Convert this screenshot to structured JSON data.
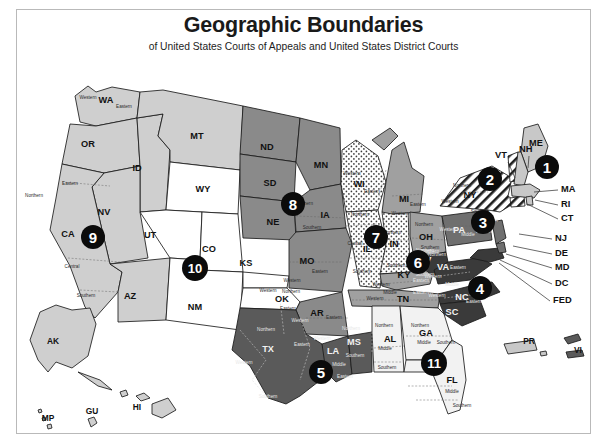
{
  "header": {
    "title": "Geographic Boundaries",
    "subtitle": "of United States Courts of Appeals and United States District Courts"
  },
  "colors": {
    "c1": "#c8c8c8",
    "c2": "#ffffff",
    "c3": "#6f6f6f",
    "c4": "#3a3a3a",
    "c5": "#5a5a5a",
    "c6": "#a0a0a0",
    "c7": "#ffffff",
    "c8": "#8a8a8a",
    "c9": "#cfcfcf",
    "c10": "#ffffff",
    "c11": "#f2f2f2",
    "border": "#1b1b1b",
    "badge_fill": "#0b0b0b",
    "badge_text": "#ffffff",
    "frame": "#b9b9b9"
  },
  "circuits": [
    {
      "number": "1",
      "badge_x": 547,
      "badge_y": 167,
      "shade": "c1",
      "states": [
        "ME",
        "NH",
        "MA",
        "RI",
        "PR"
      ]
    },
    {
      "number": "2",
      "badge_x": 490,
      "badge_y": 179,
      "shade": "c2",
      "states": [
        "VT",
        "NY",
        "CT"
      ],
      "pattern": "hatch"
    },
    {
      "number": "3",
      "badge_x": 483,
      "badge_y": 222,
      "shade": "c3",
      "states": [
        "PA",
        "NJ",
        "DE",
        "VI"
      ]
    },
    {
      "number": "4",
      "badge_x": 480,
      "badge_y": 288,
      "shade": "c4",
      "states": [
        "MD",
        "WV",
        "VA",
        "NC",
        "SC"
      ]
    },
    {
      "number": "5",
      "badge_x": 321,
      "badge_y": 372,
      "shade": "c5",
      "states": [
        "TX",
        "LA",
        "MS"
      ]
    },
    {
      "number": "6",
      "badge_x": 418,
      "badge_y": 262,
      "shade": "c6",
      "states": [
        "MI",
        "OH",
        "KY",
        "TN"
      ]
    },
    {
      "number": "7",
      "badge_x": 376,
      "badge_y": 237,
      "shade": "c7",
      "states": [
        "WI",
        "IL",
        "IN"
      ],
      "pattern": "dots"
    },
    {
      "number": "8",
      "badge_x": 293,
      "badge_y": 204,
      "shade": "c8",
      "states": [
        "ND",
        "SD",
        "MN",
        "IA",
        "NE",
        "MO",
        "AR"
      ]
    },
    {
      "number": "9",
      "badge_x": 93,
      "badge_y": 237,
      "shade": "c9",
      "states": [
        "WA",
        "OR",
        "ID",
        "MT",
        "NV",
        "CA",
        "AZ",
        "AK",
        "HI",
        "GU",
        "MP"
      ]
    },
    {
      "number": "10",
      "badge_x": 195,
      "badge_y": 268,
      "shade": "c10",
      "states": [
        "WY",
        "UT",
        "CO",
        "KS",
        "NM",
        "OK"
      ]
    },
    {
      "number": "11",
      "badge_x": 434,
      "badge_y": 363,
      "shade": "c11",
      "states": [
        "AL",
        "GA",
        "FL"
      ]
    }
  ],
  "state_labels": [
    {
      "abbr": "WA",
      "x": 106,
      "y": 101
    },
    {
      "abbr": "OR",
      "x": 88,
      "y": 145
    },
    {
      "abbr": "ID",
      "x": 137,
      "y": 169
    },
    {
      "abbr": "MT",
      "x": 197,
      "y": 137
    },
    {
      "abbr": "ND",
      "x": 267,
      "y": 148
    },
    {
      "abbr": "SD",
      "x": 270,
      "y": 184
    },
    {
      "abbr": "MN",
      "x": 321,
      "y": 166
    },
    {
      "abbr": "WY",
      "x": 203,
      "y": 190
    },
    {
      "abbr": "NV",
      "x": 104,
      "y": 213
    },
    {
      "abbr": "CA",
      "x": 68,
      "y": 235
    },
    {
      "abbr": "UT",
      "x": 150,
      "y": 236
    },
    {
      "abbr": "CO",
      "x": 209,
      "y": 250
    },
    {
      "abbr": "NE",
      "x": 273,
      "y": 223
    },
    {
      "abbr": "IA",
      "x": 325,
      "y": 216
    },
    {
      "abbr": "KS",
      "x": 246,
      "y": 264
    },
    {
      "abbr": "MO",
      "x": 307,
      "y": 262
    },
    {
      "abbr": "AZ",
      "x": 130,
      "y": 297
    },
    {
      "abbr": "NM",
      "x": 195,
      "y": 308
    },
    {
      "abbr": "OK",
      "x": 282,
      "y": 300
    },
    {
      "abbr": "AR",
      "x": 317,
      "y": 314
    },
    {
      "abbr": "WI",
      "x": 359,
      "y": 185
    },
    {
      "abbr": "MI",
      "x": 404,
      "y": 200
    },
    {
      "abbr": "IL",
      "x": 367,
      "y": 250
    },
    {
      "abbr": "IN",
      "x": 394,
      "y": 245
    },
    {
      "abbr": "OH",
      "x": 426,
      "y": 238
    },
    {
      "abbr": "KY",
      "x": 404,
      "y": 276
    },
    {
      "abbr": "TN",
      "x": 403,
      "y": 300
    },
    {
      "abbr": "MS",
      "x": 354,
      "y": 343
    },
    {
      "abbr": "AL",
      "x": 390,
      "y": 340
    },
    {
      "abbr": "GA",
      "x": 426,
      "y": 334
    },
    {
      "abbr": "LA",
      "x": 333,
      "y": 352
    },
    {
      "abbr": "TX",
      "x": 268,
      "y": 350
    },
    {
      "abbr": "FL",
      "x": 452,
      "y": 381
    },
    {
      "abbr": "SC",
      "x": 452,
      "y": 313
    },
    {
      "abbr": "NC",
      "x": 462,
      "y": 298
    },
    {
      "abbr": "VA",
      "x": 443,
      "y": 268
    },
    {
      "abbr": "WV",
      "x": 424,
      "y": 261
    },
    {
      "abbr": "PA",
      "x": 459,
      "y": 231
    },
    {
      "abbr": "NY",
      "x": 470,
      "y": 196
    },
    {
      "abbr": "ME",
      "x": 536,
      "y": 144
    }
  ],
  "territory_labels": [
    {
      "abbr": "AK",
      "x": 53,
      "y": 342
    },
    {
      "abbr": "HI",
      "x": 137,
      "y": 408
    },
    {
      "abbr": "GU",
      "x": 92,
      "y": 412
    },
    {
      "abbr": "MP",
      "x": 48,
      "y": 419
    },
    {
      "abbr": "PR",
      "x": 529,
      "y": 342
    },
    {
      "abbr": "VI",
      "x": 578,
      "y": 351
    }
  ],
  "district_labels": [
    {
      "text": "Western",
      "x": 88,
      "y": 98
    },
    {
      "text": "Eastern",
      "x": 124,
      "y": 107
    },
    {
      "text": "Northern",
      "x": 34,
      "y": 196
    },
    {
      "text": "Eastern",
      "x": 70,
      "y": 184
    },
    {
      "text": "Central",
      "x": 72,
      "y": 267
    },
    {
      "text": "Southern",
      "x": 86,
      "y": 296
    },
    {
      "text": "Northern",
      "x": 304,
      "y": 204
    },
    {
      "text": "Southern",
      "x": 312,
      "y": 228
    },
    {
      "text": "Eastern",
      "x": 320,
      "y": 272
    },
    {
      "text": "Western",
      "x": 292,
      "y": 281
    },
    {
      "text": "Western",
      "x": 268,
      "y": 291
    },
    {
      "text": "Northern",
      "x": 291,
      "y": 292
    },
    {
      "text": "Eastern",
      "x": 288,
      "y": 309
    },
    {
      "text": "Western",
      "x": 300,
      "y": 321
    },
    {
      "text": "Eastern",
      "x": 334,
      "y": 318
    },
    {
      "text": "Northern",
      "x": 266,
      "y": 330
    },
    {
      "text": "Western",
      "x": 244,
      "y": 363
    },
    {
      "text": "Eastern",
      "x": 302,
      "y": 345
    },
    {
      "text": "Southern",
      "x": 268,
      "y": 397
    },
    {
      "text": "Western",
      "x": 322,
      "y": 339
    },
    {
      "text": "Middle",
      "x": 339,
      "y": 365
    },
    {
      "text": "Eastern",
      "x": 345,
      "y": 377
    },
    {
      "text": "Northern",
      "x": 351,
      "y": 329
    },
    {
      "text": "Southern",
      "x": 355,
      "y": 356
    },
    {
      "text": "Northern",
      "x": 384,
      "y": 326
    },
    {
      "text": "Middle",
      "x": 385,
      "y": 349
    },
    {
      "text": "Southern",
      "x": 387,
      "y": 368
    },
    {
      "text": "Northern",
      "x": 420,
      "y": 326
    },
    {
      "text": "Middle",
      "x": 424,
      "y": 343
    },
    {
      "text": "Southern",
      "x": 446,
      "y": 343
    },
    {
      "text": "Middle",
      "x": 452,
      "y": 392
    },
    {
      "text": "Southern",
      "x": 462,
      "y": 406
    },
    {
      "text": "Western",
      "x": 352,
      "y": 174
    },
    {
      "text": "Eastern",
      "x": 372,
      "y": 192
    },
    {
      "text": "Northern",
      "x": 360,
      "y": 215
    },
    {
      "text": "Central",
      "x": 355,
      "y": 244
    },
    {
      "text": "Southern",
      "x": 362,
      "y": 272
    },
    {
      "text": "Northern",
      "x": 392,
      "y": 233
    },
    {
      "text": "Southern",
      "x": 396,
      "y": 266
    },
    {
      "text": "Eastern",
      "x": 418,
      "y": 205
    },
    {
      "text": "Western",
      "x": 400,
      "y": 214
    },
    {
      "text": "Northern",
      "x": 424,
      "y": 225
    },
    {
      "text": "Southern",
      "x": 430,
      "y": 248
    },
    {
      "text": "Western",
      "x": 381,
      "y": 285
    },
    {
      "text": "Eastern",
      "x": 421,
      "y": 281
    },
    {
      "text": "Middle",
      "x": 390,
      "y": 293
    },
    {
      "text": "Eastern",
      "x": 421,
      "y": 293
    },
    {
      "text": "Western",
      "x": 375,
      "y": 299
    },
    {
      "text": "Northern",
      "x": 430,
      "y": 252
    },
    {
      "text": "Northern",
      "x": 425,
      "y": 251
    },
    {
      "text": "Northern",
      "x": 437,
      "y": 255
    },
    {
      "text": "Southern",
      "x": 425,
      "y": 275
    },
    {
      "text": "Western",
      "x": 433,
      "y": 277
    },
    {
      "text": "Eastern",
      "x": 458,
      "y": 268
    },
    {
      "text": "Middle",
      "x": 452,
      "y": 285
    },
    {
      "text": "Western",
      "x": 437,
      "y": 296
    },
    {
      "text": "Eastern",
      "x": 474,
      "y": 302
    },
    {
      "text": "Western",
      "x": 448,
      "y": 230
    },
    {
      "text": "Middle",
      "x": 468,
      "y": 235
    },
    {
      "text": "Eastern",
      "x": 484,
      "y": 232
    },
    {
      "text": "Northern",
      "x": 462,
      "y": 186
    },
    {
      "text": "Western",
      "x": 450,
      "y": 202
    },
    {
      "text": "Southern",
      "x": 480,
      "y": 212
    },
    {
      "text": "Eastern",
      "x": 490,
      "y": 221
    }
  ],
  "callouts": [
    {
      "label": "VT",
      "text_x": 495,
      "text_y": 156,
      "ax": 508,
      "ay": 162,
      "bx": 515,
      "by": 178
    },
    {
      "label": "NH",
      "text_x": 519,
      "text_y": 150,
      "ax": 529,
      "ay": 156,
      "bx": 528,
      "by": 168
    },
    {
      "label": "MA",
      "text_x": 561,
      "text_y": 190,
      "ax": 558,
      "ay": 190,
      "bx": 534,
      "by": 192
    },
    {
      "label": "RI",
      "text_x": 561,
      "text_y": 205,
      "ax": 558,
      "ay": 205,
      "bx": 535,
      "by": 200
    },
    {
      "label": "CT",
      "text_x": 561,
      "text_y": 219,
      "ax": 558,
      "ay": 219,
      "bx": 527,
      "by": 204
    },
    {
      "label": "NJ",
      "text_x": 555,
      "text_y": 239,
      "ax": 552,
      "ay": 239,
      "bx": 519,
      "by": 234
    },
    {
      "label": "DE",
      "text_x": 555,
      "text_y": 254,
      "ax": 552,
      "ay": 254,
      "bx": 513,
      "by": 246
    },
    {
      "label": "MD",
      "text_x": 555,
      "text_y": 268,
      "ax": 552,
      "ay": 268,
      "bx": 506,
      "by": 254
    },
    {
      "label": "DC",
      "text_x": 555,
      "text_y": 284,
      "ax": 552,
      "ay": 284,
      "bx": 500,
      "by": 260
    },
    {
      "label": "FED",
      "text_x": 553,
      "text_y": 301,
      "ax": 550,
      "ay": 301,
      "bx": 499,
      "by": 263
    }
  ]
}
